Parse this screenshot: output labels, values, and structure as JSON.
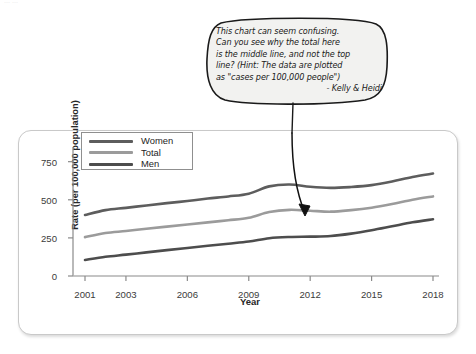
{
  "top_sliver_text": "... ...",
  "callout": {
    "lines": [
      "This chart can seem confusing.",
      "Can you see why the total here",
      "is the middle line, and not the top",
      "line? (Hint: The data are plotted",
      "as \"cases per 100,000 people\")"
    ],
    "signature": "- Kelly & Heidi",
    "bubble_fill": "#f2f2f0",
    "bubble_stroke": "#1a1a1a",
    "arrow_color": "#111111",
    "arrow_target_label": "Total line near 2011"
  },
  "chart_data": {
    "type": "line",
    "title": "",
    "xlabel": "Year",
    "ylabel": "Rate (per 100,000 population)",
    "xlim": [
      2001,
      2018
    ],
    "ylim": [
      0,
      820
    ],
    "yticks": [
      0,
      250,
      500,
      750
    ],
    "xticks": [
      2001,
      2003,
      2006,
      2009,
      2012,
      2015,
      2018
    ],
    "grid": false,
    "legend_position": "top-left-inside",
    "x": [
      2001,
      2002,
      2003,
      2004,
      2005,
      2006,
      2007,
      2008,
      2009,
      2010,
      2011,
      2012,
      2013,
      2014,
      2015,
      2016,
      2017,
      2018
    ],
    "series": [
      {
        "name": "Women",
        "color": "#5d5d5d",
        "values": [
          400,
          432,
          447,
          463,
          478,
          492,
          508,
          522,
          540,
          588,
          600,
          585,
          578,
          584,
          596,
          620,
          650,
          672
        ]
      },
      {
        "name": "Total",
        "color": "#9b9b9b",
        "values": [
          255,
          282,
          295,
          310,
          324,
          338,
          352,
          366,
          382,
          420,
          434,
          428,
          422,
          432,
          448,
          472,
          500,
          522
        ]
      },
      {
        "name": "Men",
        "color": "#4d4d4d",
        "values": [
          105,
          126,
          140,
          155,
          170,
          184,
          198,
          212,
          226,
          248,
          256,
          258,
          262,
          278,
          300,
          326,
          352,
          372
        ]
      }
    ]
  },
  "card": {
    "background": "#ffffff",
    "border_color": "#c9c9c9"
  }
}
